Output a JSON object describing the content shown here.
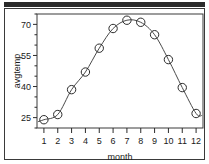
{
  "figure": {
    "background_color": "#ffffff",
    "frame_color": "#3a3a3a",
    "top_bar_color": "#2b2b2b"
  },
  "chart_data": {
    "type": "scatter",
    "title": "",
    "subtitle": "",
    "xlabel": "month",
    "ylabel": "avgtemp",
    "x": [
      1,
      2,
      3,
      4,
      5,
      6,
      7,
      8,
      9,
      10,
      11,
      12
    ],
    "values": [
      24,
      26.5,
      38.5,
      47,
      58.5,
      68,
      72,
      71,
      65,
      53,
      39.5,
      27
    ],
    "series": [
      {
        "name": "avgtemp",
        "values": [
          24,
          26.5,
          38.5,
          47,
          58.5,
          68,
          72,
          71,
          65,
          53,
          39.5,
          27
        ]
      }
    ],
    "xtick_labels": [
      "1",
      "2",
      "3",
      "4",
      "5",
      "6",
      "7",
      "8",
      "9",
      "10",
      "11",
      "12"
    ],
    "ytick_labels": [
      "25",
      "40",
      "55",
      "70"
    ],
    "ytick_values": [
      25,
      40,
      55,
      70
    ],
    "xlim": [
      0.5,
      12.5
    ],
    "ylim": [
      20,
      75
    ],
    "grid": false,
    "legend": false,
    "marker": "open-circle",
    "marker_color": "#2b2b2b",
    "line_color": "#4a4a4a",
    "fit_line": "smooth-curve"
  }
}
